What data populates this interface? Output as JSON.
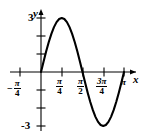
{
  "chart_data": {
    "type": "line",
    "title": "",
    "subtitle": "",
    "xlabel": "x",
    "ylabel": "y",
    "function": "y = 3 sin(2x)",
    "amplitude": 3,
    "period": "pi",
    "xlim": [
      -0.9,
      3.45
    ],
    "ylim": [
      -3.6,
      3.6
    ],
    "grid": false,
    "legend": null,
    "x_tick_labels": [
      "-π/4",
      "π/4",
      "π/2",
      "3π/4",
      "π"
    ],
    "x_tick_values": [
      -0.7853981634,
      0.7853981634,
      1.5707963268,
      2.3561944902,
      3.1415926536
    ],
    "y_tick_labels": [
      "3",
      "-3"
    ],
    "y_tick_values": [
      3,
      -3
    ],
    "y_minor_ticks": [
      1,
      2,
      -1,
      -2
    ],
    "x": [
      0,
      0.0982,
      0.1963,
      0.2945,
      0.3927,
      0.4909,
      0.589,
      0.6872,
      0.7854,
      0.8836,
      0.9817,
      1.0799,
      1.1781,
      1.2763,
      1.3744,
      1.4726,
      1.5708,
      1.669,
      1.7671,
      1.8653,
      1.9635,
      2.0617,
      2.1598,
      2.258,
      2.3562,
      2.4544,
      2.5525,
      2.6507,
      2.7489,
      2.8471,
      2.9452,
      3.0434,
      3.1416
    ],
    "y": [
      0,
      0.5853,
      1.1481,
      1.6669,
      2.1213,
      2.4927,
      2.7716,
      2.9424,
      3,
      2.9424,
      2.7716,
      2.4927,
      2.1213,
      1.6669,
      1.1481,
      0.5853,
      0,
      -0.5853,
      -1.1481,
      -1.6669,
      -2.1213,
      -2.4927,
      -2.7716,
      -2.9424,
      -3,
      -2.9424,
      -2.7716,
      -2.4927,
      -2.1213,
      -1.6669,
      -1.1481,
      -0.5853,
      0
    ],
    "curve_color": "#000000",
    "axis_color": "#000000"
  },
  "labels": {
    "y_axis_name": "y",
    "x_axis_name": "x",
    "y_top_value": "3",
    "y_bottom_value": "-3",
    "minus_sign": "−",
    "neg_quarter_pi_num": "π",
    "neg_quarter_pi_den": "4",
    "quarter_pi_num": "π",
    "quarter_pi_den": "4",
    "half_pi_num": "π",
    "half_pi_den": "2",
    "three_quarter_pi_num": "3π",
    "three_quarter_pi_den": "4",
    "pi_label": "π"
  }
}
